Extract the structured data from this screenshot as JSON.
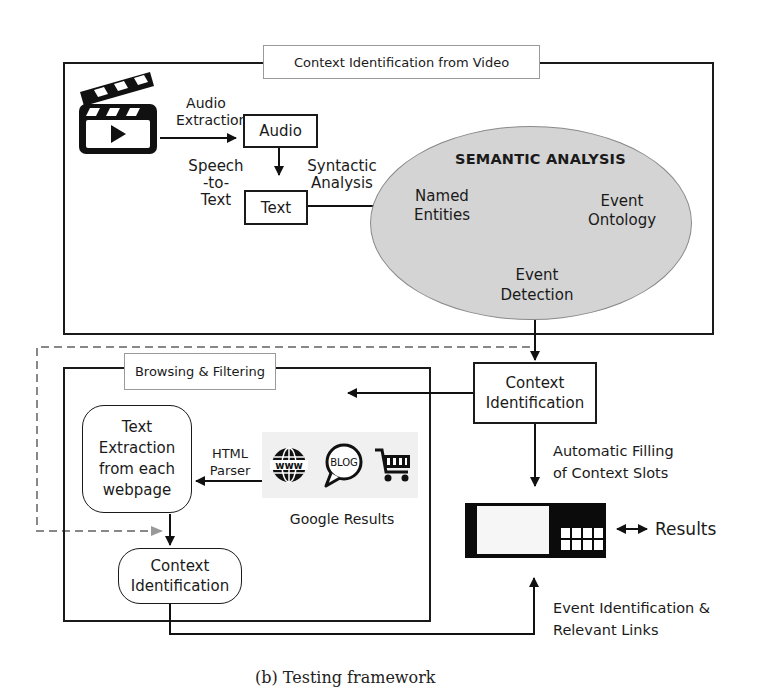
{
  "top_section": {
    "title": "Context Identification from Video",
    "video_icon": "film-clapper-play-icon",
    "audio_extraction_label": [
      "Audio",
      "Extraction"
    ],
    "audio_box": "Audio",
    "speech_to_text_label": [
      "Speech",
      "-to-",
      "Text"
    ],
    "text_box": "Text",
    "syntactic_label": [
      "Syntactic",
      "Analysis"
    ],
    "semantic": {
      "title": "SEMANTIC ANALYSIS",
      "named_entities": [
        "Named",
        "Entities"
      ],
      "event_ontology": [
        "Event",
        "Ontology"
      ],
      "event_detection": [
        "Event",
        "Detection"
      ]
    }
  },
  "context_identification_main": [
    "Context",
    "Identification"
  ],
  "bottom_section": {
    "title": "Browsing & Filtering",
    "text_extraction": [
      "Text",
      "Extraction",
      "from each",
      "webpage"
    ],
    "html_parser_label": [
      "HTML",
      "Parser"
    ],
    "google_icons": [
      "www-globe-icon",
      "blog-bubble-icon",
      "shopping-cart-icon"
    ],
    "google_results_label": "Google Results",
    "context_identification": [
      "Context",
      "Identification"
    ]
  },
  "right_side": {
    "auto_fill_label": [
      "Automatic Filling",
      "of Context Slots"
    ],
    "results_label": "Results",
    "event_identification_label": [
      "Event Identification &",
      "Relevant Links"
    ]
  },
  "caption": "(b) Testing framework"
}
